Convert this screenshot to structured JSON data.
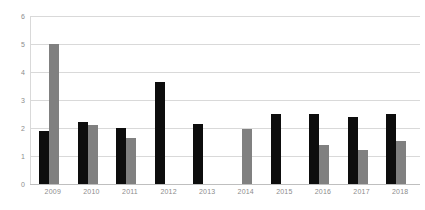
{
  "chart_data": {
    "type": "bar",
    "title": "",
    "subtitle": "",
    "xlabel": "",
    "ylabel": "",
    "categories": [
      "2009",
      "2010",
      "2011",
      "2012",
      "2013",
      "2014",
      "2015",
      "2016",
      "2017",
      "2018"
    ],
    "series": [
      {
        "name": "Series 1",
        "color": "#0d0d0d",
        "values": [
          1.9,
          2.2,
          2.0,
          3.65,
          2.15,
          null,
          2.5,
          2.5,
          2.4,
          2.5
        ]
      },
      {
        "name": "Series 2",
        "color": "#808080",
        "values": [
          5.0,
          2.1,
          1.65,
          null,
          null,
          1.95,
          null,
          1.4,
          1.2,
          1.55
        ]
      }
    ],
    "ylim": [
      0,
      6
    ],
    "yticks": [
      0,
      1,
      2,
      3,
      4,
      5,
      6
    ],
    "ytick_labels": [
      "0",
      "1",
      "2",
      "3",
      "4",
      "5",
      "6"
    ],
    "grid": true,
    "grid_axis": "y",
    "legend": false,
    "legend_position": "none",
    "annotations": []
  },
  "style": {
    "background": "#ffffff",
    "grid_color": "#d9d9d9",
    "axis_color": "#d9d9d9",
    "tick_label_color": "#8c8c8c"
  }
}
